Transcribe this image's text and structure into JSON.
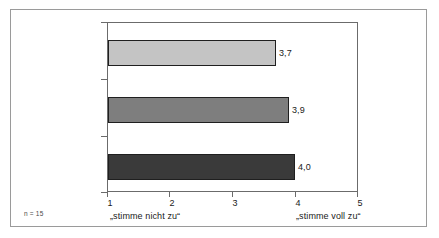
{
  "chart_data": {
    "type": "bar",
    "orientation": "horizontal",
    "title": "",
    "subtitle": "",
    "xlabel": "",
    "ylabel": "",
    "categories": [
      "Früher",
      "Heute",
      "Zukunft"
    ],
    "values": [
      3.7,
      3.9,
      4.0
    ],
    "value_labels": [
      "3,7",
      "3,9",
      "4,0"
    ],
    "series": [
      {
        "name": "Mittelwert",
        "values": [
          3.7,
          3.9,
          4.0
        ]
      }
    ],
    "xlim": [
      1,
      5
    ],
    "ylim": null,
    "xticks": [
      1,
      2,
      3,
      4,
      5
    ],
    "xtick_labels": [
      "1",
      "2",
      "3",
      "4",
      "5"
    ],
    "grid": false,
    "legend": null,
    "legend_position": "none",
    "bar_colors": [
      "#C4C4C4",
      "#7E7E7E",
      "#3A3A3A"
    ],
    "bar_border_color": "#1F1F1F",
    "axis_color": "#6B6B6B",
    "frame_color": "#9A9A9A",
    "background": "#FFFFFF",
    "annotations": {
      "scale_anchor_low": "„stimme nicht zu“",
      "scale_anchor_high": "„stimme voll zu“",
      "sample_size": "n = 15"
    }
  },
  "axis": {
    "anchor_low": "„stimme nicht zu“",
    "anchor_high": "„stimme voll zu“"
  },
  "footer": {
    "sample_size": "n = 15"
  }
}
